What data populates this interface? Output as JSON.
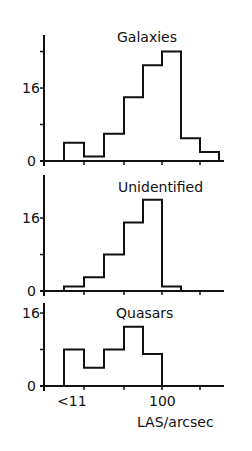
{
  "chart_data": {
    "type": "bar",
    "subtype": "stacked-panel-histogram",
    "xlabel": "LAS/arcsec",
    "x_tick_labels": [
      "<11",
      "100"
    ],
    "bin_edges_px": [
      64,
      84,
      104,
      124,
      143,
      162,
      181,
      200,
      219
    ],
    "categories": [
      "<1",
      "1-2",
      "2-5",
      "5-10",
      "10-20",
      "20-50",
      "50-100",
      "100-200"
    ],
    "grid": false,
    "legend": null,
    "panels": [
      {
        "title": "Galaxies",
        "ylabel_ticks": [
          "16",
          "0"
        ],
        "yticks": [
          0,
          8,
          16,
          24
        ],
        "ylim": [
          0,
          26
        ],
        "values": [
          4,
          1,
          6,
          14,
          21,
          24,
          5,
          2
        ]
      },
      {
        "title": "Unidentified",
        "ylabel_ticks": [
          "16",
          "0"
        ],
        "yticks": [
          0,
          8,
          16
        ],
        "ylim": [
          0,
          20
        ],
        "values": [
          1,
          3,
          8,
          15,
          20,
          1,
          0,
          0
        ]
      },
      {
        "title": "Quasars",
        "ylabel_ticks": [
          "16",
          "0"
        ],
        "yticks": [
          0,
          8,
          16
        ],
        "ylim": [
          0,
          16
        ],
        "values": [
          8,
          4,
          8,
          13,
          7,
          0,
          0,
          0
        ]
      }
    ]
  }
}
